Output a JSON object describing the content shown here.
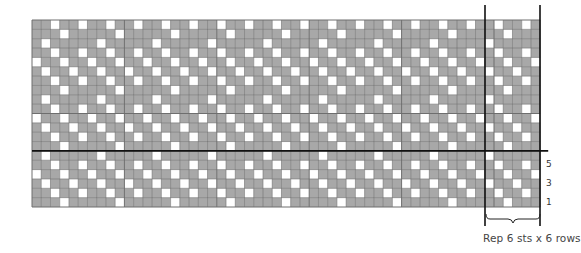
{
  "chart_data": {
    "type": "table",
    "grid": {
      "columns": 55,
      "rows": 20,
      "left": 32,
      "top": 20,
      "cell_width": 9.24,
      "cell_height": 9.35
    },
    "colors": {
      "filled": "#a8a8a8",
      "empty": "#ffffff",
      "gridline": "#6e6e6e",
      "bold_line": "#111111"
    },
    "repeat": {
      "stitches": 6,
      "rows": 6,
      "start_column_from_left": 50,
      "pattern_bottom_to_top": [
        [
          1,
          1,
          0,
          1,
          1,
          1
        ],
        [
          1,
          0,
          1,
          1,
          0,
          1
        ],
        [
          0,
          1,
          1,
          0,
          1,
          1
        ],
        [
          1,
          1,
          0,
          1,
          1,
          0
        ],
        [
          1,
          0,
          1,
          1,
          0,
          1
        ],
        [
          0,
          1,
          1,
          1,
          1,
          1
        ]
      ],
      "pattern_note": "0 = white (contrast), 1 = grey (main)"
    },
    "bold_horizontal_after_row_from_bottom": 6,
    "row_labels": [
      {
        "row": 5,
        "label": "5"
      },
      {
        "row": 3,
        "label": "3"
      },
      {
        "row": 1,
        "label": "1"
      }
    ],
    "caption": "Rep 6 sts x 6 rows"
  }
}
